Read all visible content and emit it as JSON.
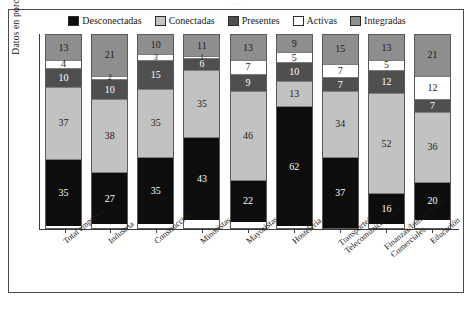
{
  "figure": {
    "top_fragment": "· · · ·",
    "caption": " "
  },
  "axes": {
    "ylabel": "Datos en porcentaje"
  },
  "legend": {
    "items": [
      {
        "label": "Desconectadas",
        "color": "#0d0d0d"
      },
      {
        "label": "Conectadas",
        "color": "#c2c2c2"
      },
      {
        "label": "Presentes",
        "color": "#4f4f4f"
      },
      {
        "label": "Activas",
        "color": "#ffffff"
      },
      {
        "label": "Integradas",
        "color": "#8e8e8e"
      }
    ]
  },
  "chart_data": {
    "type": "bar",
    "subtype": "stacked-column-100",
    "title": "",
    "xlabel": "",
    "ylabel": "Datos en porcentaje",
    "ylim": [
      0,
      100
    ],
    "grid": false,
    "legend_position": "top-center",
    "categories": [
      "Total empresas",
      "Industria",
      "Construcción",
      "Minoristas",
      "Mayoristas",
      "Hostelería",
      "Transporte/ Telecomunicaciones",
      "Finanzas/Inmobiliarias Comerciales",
      "Educación"
    ],
    "category_lines": [
      [
        "Total empresas"
      ],
      [
        "Industria"
      ],
      [
        "Construcción"
      ],
      [
        "Minoristas"
      ],
      [
        "Mayoristas"
      ],
      [
        "Hostelería"
      ],
      [
        "Transporte/",
        "Telecomunicaciones"
      ],
      [
        "Finanzas/Inmobiliarias",
        "Comerciales"
      ],
      [
        "Educación"
      ]
    ],
    "series": [
      {
        "name": "Desconectadas",
        "color": "#0d0d0d",
        "text_color": "#ffffff",
        "values": [
          35,
          27,
          35,
          43,
          22,
          62,
          37,
          16,
          20
        ]
      },
      {
        "name": "Conectadas",
        "color": "#c2c2c2",
        "text_color": "#1a1a1a",
        "values": [
          37,
          38,
          35,
          35,
          46,
          13,
          34,
          52,
          36
        ]
      },
      {
        "name": "Presentes",
        "color": "#4f4f4f",
        "text_color": "#ffffff",
        "values": [
          10,
          10,
          15,
          6,
          9,
          10,
          7,
          12,
          7
        ]
      },
      {
        "name": "Activas",
        "color": "#ffffff",
        "text_color": "#1a1a1a",
        "values": [
          4,
          2,
          3,
          1,
          7,
          5,
          7,
          5,
          12
        ]
      },
      {
        "name": "Integradas",
        "color": "#8e8e8e",
        "text_color": "#1a1a1a",
        "values": [
          13,
          21,
          10,
          11,
          13,
          9,
          15,
          13,
          21
        ]
      }
    ]
  }
}
